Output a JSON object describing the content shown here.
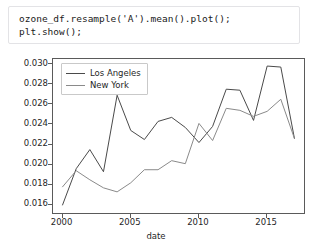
{
  "code_cell": {
    "lines": [
      "ozone_df.resample('A').mean().plot();",
      "plt.show();"
    ],
    "text": "ozone_df.resample('A').mean().plot();\nplt.show();"
  },
  "chart_data": {
    "type": "line",
    "title": "",
    "xlabel": "date",
    "ylabel": "",
    "xlim": [
      1999.3,
      2017.7
    ],
    "ylim": [
      0.0152,
      0.0305
    ],
    "grid": false,
    "legend_position": "upper left",
    "xticks": [
      "2000",
      "2005",
      "2010",
      "2015"
    ],
    "xtick_values": [
      2000,
      2005,
      2010,
      2015
    ],
    "yticks": [
      "0.016",
      "0.018",
      "0.020",
      "0.022",
      "0.024",
      "0.026",
      "0.028",
      "0.030"
    ],
    "ytick_values": [
      0.016,
      0.018,
      0.02,
      0.022,
      0.024,
      0.026,
      0.028,
      0.03
    ],
    "x": [
      2000,
      2001,
      2002,
      2003,
      2004,
      2005,
      2006,
      2007,
      2008,
      2009,
      2010,
      2011,
      2012,
      2013,
      2014,
      2015,
      2016,
      2017
    ],
    "series": [
      {
        "name": "Los Angeles",
        "color": "#4a4a4a",
        "values": [
          0.016,
          0.0196,
          0.0215,
          0.0193,
          0.0269,
          0.0234,
          0.0225,
          0.0243,
          0.0247,
          0.0237,
          0.0222,
          0.0238,
          0.0275,
          0.0274,
          0.0244,
          0.0298,
          0.0297,
          0.0226
        ]
      },
      {
        "name": "New York",
        "color": "#8a8a8a",
        "values": [
          0.0178,
          0.0194,
          0.0185,
          0.0177,
          0.0173,
          0.0182,
          0.0195,
          0.0195,
          0.0204,
          0.0201,
          0.0241,
          0.0224,
          0.0256,
          0.0254,
          0.0248,
          0.0253,
          0.0265,
          0.0226
        ]
      }
    ]
  }
}
